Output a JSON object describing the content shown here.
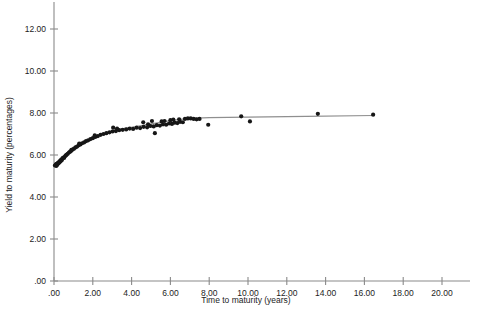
{
  "chart_data": {
    "type": "scatter",
    "title": "",
    "subtitle": "",
    "xlabel": "Time to maturity (years)",
    "ylabel": "Yield to maturity (percentages)",
    "xlim": [
      0.0,
      20.8
    ],
    "ylim": [
      0.0,
      13.1
    ],
    "xticks": [
      0.0,
      2.0,
      4.0,
      6.0,
      8.0,
      10.0,
      12.0,
      14.0,
      16.0,
      18.0,
      20.0
    ],
    "xtick_labels": [
      ".00",
      "2.00",
      "4.00",
      "6.00",
      "8.00",
      "10.00",
      "12.00",
      "14.00",
      "16.00",
      "18.00",
      "20.00"
    ],
    "yticks": [
      0.0,
      2.0,
      4.0,
      6.0,
      8.0,
      10.0,
      12.0
    ],
    "ytick_labels": [
      ".00",
      "2.00",
      "4.00",
      "6.00",
      "8.00",
      "10.00",
      "12.00"
    ],
    "grid": false,
    "legend": null,
    "marker_color": "#161616",
    "fit_line_color": "#8f8f8f",
    "axis_color": "#8a8a8a",
    "series": [
      {
        "name": "Bond observations",
        "marker": "filled-circle",
        "points": [
          [
            0.05,
            5.5
          ],
          [
            0.08,
            5.52
          ],
          [
            0.1,
            5.55
          ],
          [
            0.12,
            5.48
          ],
          [
            0.14,
            5.58
          ],
          [
            0.17,
            5.53
          ],
          [
            0.19,
            5.62
          ],
          [
            0.22,
            5.6
          ],
          [
            0.25,
            5.66
          ],
          [
            0.28,
            5.64
          ],
          [
            0.31,
            5.72
          ],
          [
            0.34,
            5.7
          ],
          [
            0.37,
            5.78
          ],
          [
            0.41,
            5.76
          ],
          [
            0.44,
            5.84
          ],
          [
            0.48,
            5.88
          ],
          [
            0.52,
            5.86
          ],
          [
            0.57,
            5.94
          ],
          [
            0.61,
            5.98
          ],
          [
            0.66,
            6.02
          ],
          [
            0.71,
            6.06
          ],
          [
            0.77,
            6.12
          ],
          [
            0.83,
            6.16
          ],
          [
            0.89,
            6.2
          ],
          [
            0.96,
            6.26
          ],
          [
            1.03,
            6.3
          ],
          [
            1.11,
            6.36
          ],
          [
            1.19,
            6.4
          ],
          [
            1.27,
            6.46
          ],
          [
            1.36,
            6.5
          ],
          [
            1.45,
            6.56
          ],
          [
            1.55,
            6.6
          ],
          [
            1.65,
            6.66
          ],
          [
            1.76,
            6.7
          ],
          [
            1.88,
            6.76
          ],
          [
            2.0,
            6.8
          ],
          [
            2.13,
            6.86
          ],
          [
            2.26,
            6.9
          ],
          [
            2.4,
            6.96
          ],
          [
            2.55,
            7.0
          ],
          [
            2.7,
            7.04
          ],
          [
            2.86,
            7.08
          ],
          [
            3.02,
            7.12
          ],
          [
            3.19,
            7.14
          ],
          [
            3.36,
            7.18
          ],
          [
            3.54,
            7.2
          ],
          [
            3.72,
            7.22
          ],
          [
            3.9,
            7.26
          ],
          [
            4.08,
            7.24
          ],
          [
            4.26,
            7.3
          ],
          [
            4.44,
            7.28
          ],
          [
            4.62,
            7.34
          ],
          [
            4.8,
            7.32
          ],
          [
            4.97,
            7.38
          ],
          [
            5.14,
            7.36
          ],
          [
            5.3,
            7.42
          ],
          [
            5.46,
            7.4
          ],
          [
            5.62,
            7.46
          ],
          [
            5.78,
            7.44
          ],
          [
            5.93,
            7.5
          ],
          [
            6.08,
            7.48
          ],
          [
            6.22,
            7.54
          ],
          [
            6.36,
            7.52
          ],
          [
            6.5,
            7.58
          ],
          [
            6.64,
            7.56
          ],
          [
            5.2,
            7.04
          ],
          [
            5.55,
            7.6
          ],
          [
            5.7,
            7.62
          ],
          [
            6.0,
            7.66
          ],
          [
            6.15,
            7.68
          ],
          [
            6.45,
            7.7
          ],
          [
            6.75,
            7.72
          ],
          [
            6.9,
            7.74
          ],
          [
            7.05,
            7.74
          ],
          [
            7.2,
            7.72
          ],
          [
            7.35,
            7.7
          ],
          [
            7.5,
            7.72
          ],
          [
            4.6,
            7.56
          ],
          [
            4.85,
            7.46
          ],
          [
            5.05,
            7.62
          ],
          [
            3.05,
            7.3
          ],
          [
            3.25,
            7.26
          ],
          [
            2.1,
            6.94
          ],
          [
            1.3,
            6.54
          ],
          [
            0.9,
            6.24
          ],
          [
            7.95,
            7.44
          ],
          [
            9.65,
            7.84
          ],
          [
            10.1,
            7.6
          ],
          [
            13.6,
            7.96
          ],
          [
            16.45,
            7.92
          ]
        ]
      }
    ],
    "fit_curve": {
      "name": "Fitted yield curve",
      "points": [
        [
          0.05,
          5.52
        ],
        [
          0.3,
          5.74
        ],
        [
          0.6,
          5.98
        ],
        [
          1.0,
          6.28
        ],
        [
          1.5,
          6.58
        ],
        [
          2.0,
          6.82
        ],
        [
          2.5,
          7.0
        ],
        [
          3.0,
          7.14
        ],
        [
          3.5,
          7.24
        ],
        [
          4.0,
          7.32
        ],
        [
          4.5,
          7.4
        ],
        [
          5.0,
          7.48
        ],
        [
          5.5,
          7.56
        ],
        [
          6.0,
          7.64
        ],
        [
          6.5,
          7.7
        ],
        [
          7.0,
          7.74
        ],
        [
          8.0,
          7.78
        ],
        [
          10.0,
          7.8
        ],
        [
          13.0,
          7.84
        ],
        [
          16.45,
          7.88
        ]
      ]
    }
  }
}
